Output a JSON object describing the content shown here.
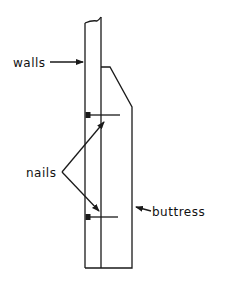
{
  "diagram": {
    "type": "technical-drawing",
    "labels": {
      "walls": "walls",
      "nails": "nails",
      "buttress": "buttress"
    },
    "colors": {
      "ink": "#1a1a1a",
      "background": "#ffffff"
    }
  }
}
